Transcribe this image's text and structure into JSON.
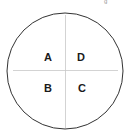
{
  "diagram": {
    "type": "quadrant-circle",
    "quadrants": [
      {
        "position": "top-left",
        "label": "A"
      },
      {
        "position": "top-right",
        "label": "D"
      },
      {
        "position": "bottom-left",
        "label": "B"
      },
      {
        "position": "bottom-right",
        "label": "C"
      }
    ],
    "colors": {
      "outline": "#333333",
      "divider": "#c8c8c8",
      "text": "#1a1a1a"
    }
  }
}
